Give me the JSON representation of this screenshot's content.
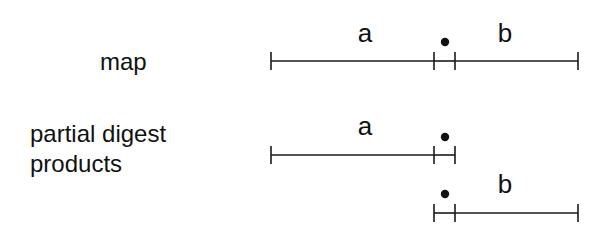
{
  "labels": {
    "map": "map",
    "partial_digest_line1": "partial digest",
    "partial_digest_line2": "products"
  },
  "diagram": {
    "stroke_color": "#1a1a1a",
    "rows": [
      {
        "name": "map",
        "y": 61,
        "segments": [
          {
            "label": "a",
            "x1": 271,
            "x2": 434
          },
          {
            "label": "",
            "x1": 434,
            "x2": 455
          },
          {
            "label": "b",
            "x1": 455,
            "x2": 578
          }
        ],
        "dot": {
          "x": 445,
          "y": 42
        },
        "segment_labels": [
          {
            "text": "a",
            "x": 365,
            "y": 42
          },
          {
            "text": "b",
            "x": 505,
            "y": 42
          }
        ]
      },
      {
        "name": "partial-product-a",
        "y": 155,
        "segments": [
          {
            "label": "a",
            "x1": 271,
            "x2": 434
          },
          {
            "label": "",
            "x1": 434,
            "x2": 455
          }
        ],
        "dot": {
          "x": 445,
          "y": 137
        },
        "segment_labels": [
          {
            "text": "a",
            "x": 365,
            "y": 135
          }
        ]
      },
      {
        "name": "partial-product-b",
        "y": 213,
        "segments": [
          {
            "label": "",
            "x1": 434,
            "x2": 455
          },
          {
            "label": "b",
            "x1": 455,
            "x2": 578
          }
        ],
        "dot": {
          "x": 445,
          "y": 194
        },
        "segment_labels": [
          {
            "text": "b",
            "x": 505,
            "y": 193
          }
        ]
      }
    ]
  }
}
